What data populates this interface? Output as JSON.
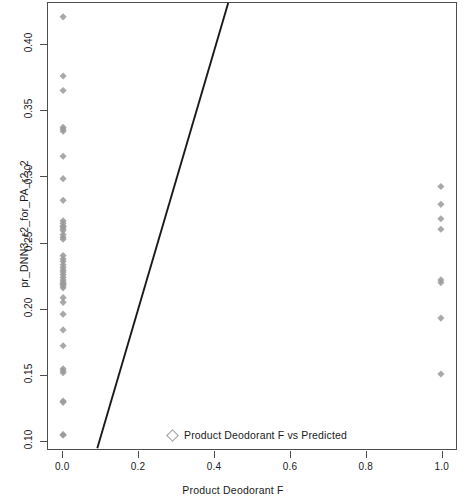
{
  "chart_data": {
    "type": "scatter",
    "title": "",
    "xlabel": "Product Deodorant F",
    "ylabel": "pr_DNN3_r2_for_PA_r2_2",
    "xlim": [
      -0.04,
      1.04
    ],
    "ylim": [
      0.093,
      0.432
    ],
    "xticks": [
      "0.0",
      "0.2",
      "0.4",
      "0.6",
      "0.8",
      "1.0"
    ],
    "xtick_values": [
      0.0,
      0.2,
      0.4,
      0.6,
      0.8,
      1.0
    ],
    "yticks": [
      "0.10",
      "0.15",
      "0.20",
      "0.25",
      "0.30",
      "0.35",
      "0.40"
    ],
    "ytick_values": [
      0.1,
      0.15,
      0.2,
      0.25,
      0.3,
      0.35,
      0.4
    ],
    "grid": false,
    "marker": "diamond",
    "marker_color": "#9a9a9a",
    "line_color": "#1a1a1a",
    "legend": {
      "position": "bottom-center-inside",
      "entries": [
        {
          "label": "Product Deodorant F vs Predicted",
          "marker": "diamond",
          "color": "#9a9a9a"
        }
      ]
    },
    "series": [
      {
        "name": "Product Deodorant F vs Predicted",
        "x": [
          0,
          0,
          0,
          0,
          0,
          0,
          0,
          0,
          0,
          0,
          0,
          0,
          0,
          0,
          0,
          0,
          0,
          0,
          0,
          0,
          0,
          0,
          0,
          0,
          0,
          0,
          0,
          0,
          0,
          0,
          0,
          0,
          0,
          0,
          0,
          0,
          0,
          0,
          0,
          0,
          0,
          0,
          0,
          0,
          0,
          1,
          1,
          1,
          1,
          1,
          1,
          1,
          1
        ],
        "y": [
          0.4215,
          0.3765,
          0.3655,
          0.3375,
          0.336,
          0.3345,
          0.3155,
          0.2985,
          0.282,
          0.2665,
          0.2645,
          0.2625,
          0.2605,
          0.256,
          0.254,
          0.2525,
          0.24,
          0.2375,
          0.2355,
          0.233,
          0.231,
          0.229,
          0.2275,
          0.2255,
          0.2235,
          0.2215,
          0.22,
          0.2185,
          0.217,
          0.2155,
          0.208,
          0.2045,
          0.1955,
          0.1835,
          0.1715,
          0.154,
          0.1525,
          0.151,
          0.1295,
          0.1285,
          0.104,
          0.1035,
          0.262,
          0.259,
          0.2185,
          0.2925,
          0.279,
          0.268,
          0.26,
          0.2215,
          0.2195,
          0.1925,
          0.15
        ]
      }
    ],
    "fit_line": {
      "name": "fitted regression line",
      "x0": 0.0905,
      "y0": 0.0935,
      "x1": 0.4375,
      "y1": 0.4325
    }
  },
  "axis": {
    "x_title": "Product Deodorant F",
    "y_title": "pr_DNN3_r2_for_PA_r2_2"
  }
}
